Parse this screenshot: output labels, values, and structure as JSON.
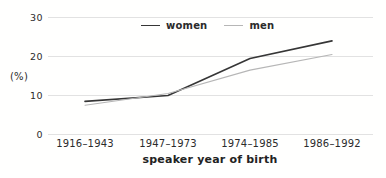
{
  "chart_data": {
    "type": "line",
    "categories": [
      "1916–1943",
      "1947–1973",
      "1974–1985",
      "1986–1992"
    ],
    "series": [
      {
        "name": "women",
        "values": [
          8.5,
          10,
          19.5,
          24
        ],
        "color": "#363636",
        "stroke_width": 1.6
      },
      {
        "name": "men",
        "values": [
          7.5,
          10.5,
          16.5,
          20.5
        ],
        "color": "#b6b6b6",
        "stroke_width": 1.1
      }
    ],
    "title": "",
    "xlabel": "speaker year of birth",
    "ylabel": "(%)",
    "ylim": [
      0,
      30
    ],
    "yticks": [
      0,
      10,
      20,
      30
    ],
    "grid": true,
    "gridline_color": "#dadada",
    "legend_position": "top-center",
    "text_color": "#2b2b2b"
  }
}
